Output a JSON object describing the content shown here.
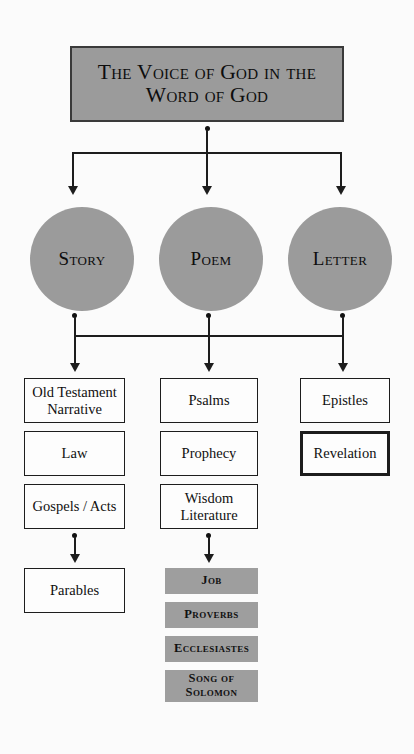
{
  "diagram": {
    "title": "The Voice of God in the Word of God",
    "colors": {
      "fill_gray": "#9b9b9b",
      "book_gray": "#9e9e9e",
      "line": "#1d1d1d",
      "background": "#fbfbfb",
      "text": "#101010"
    },
    "circles": [
      {
        "label": "Story"
      },
      {
        "label": "Poem"
      },
      {
        "label": "Letter"
      }
    ],
    "columns": [
      {
        "parent": "Story",
        "boxes": [
          {
            "label": "Old Testament Narrative",
            "style": "outline"
          },
          {
            "label": "Law",
            "style": "outline"
          },
          {
            "label": "Gospels / Acts",
            "style": "outline"
          }
        ],
        "sub_boxes": [
          {
            "label": "Parables",
            "style": "outline"
          }
        ]
      },
      {
        "parent": "Poem",
        "boxes": [
          {
            "label": "Psalms",
            "style": "outline"
          },
          {
            "label": "Prophecy",
            "style": "outline"
          },
          {
            "label": "Wisdom Literature",
            "style": "outline"
          }
        ],
        "sub_boxes": [
          {
            "label": "Job",
            "style": "filled"
          },
          {
            "label": "Proverbs",
            "style": "filled"
          },
          {
            "label": "Ecclesiastes",
            "style": "filled"
          },
          {
            "label": "Song of Solomon",
            "style": "filled"
          }
        ]
      },
      {
        "parent": "Letter",
        "boxes": [
          {
            "label": "Epistles",
            "style": "outline"
          },
          {
            "label": "Revelation",
            "style": "outline-heavy"
          }
        ],
        "sub_boxes": []
      }
    ]
  }
}
